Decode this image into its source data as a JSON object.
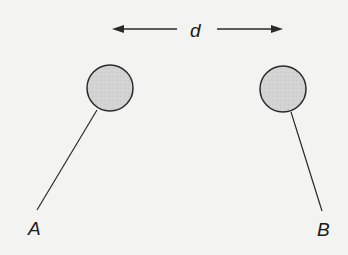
{
  "diagram": {
    "type": "charged-spheres-on-threads",
    "distance_label": "d",
    "colors": {
      "background": "#f3f3f2",
      "sphere_fill": "#d2d2d2",
      "stroke": "#2a2a2a",
      "text": "#1a1a1a"
    },
    "spheres": [
      {
        "id": "A",
        "label": "A",
        "cx": 110,
        "cy": 88,
        "r": 23,
        "thread": {
          "x1": 97,
          "y1": 110,
          "x2": 37,
          "y2": 210
        },
        "label_pos": {
          "x": 28,
          "y": 219
        }
      },
      {
        "id": "B",
        "label": "B",
        "cx": 283,
        "cy": 89,
        "r": 23,
        "thread": {
          "x1": 291,
          "y1": 112,
          "x2": 322,
          "y2": 211
        },
        "label_pos": {
          "x": 317,
          "y": 220
        }
      }
    ],
    "distance_arrow": {
      "left": {
        "x_tip": 112,
        "x_tail": 177,
        "y": 29
      },
      "right": {
        "x_tail": 217,
        "x_tip": 283,
        "y": 29
      },
      "label_pos": {
        "x": 189,
        "y": 21
      }
    }
  }
}
